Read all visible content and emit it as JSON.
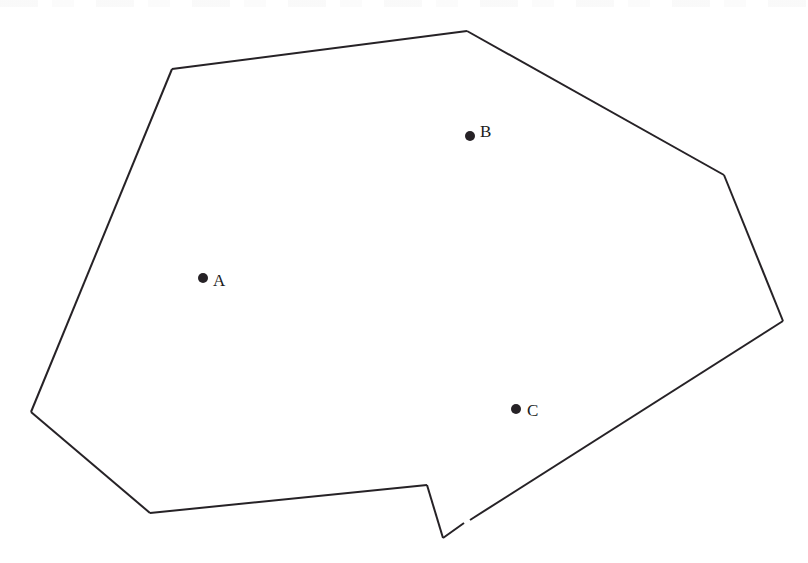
{
  "figure": {
    "kind": "polygon-line-drawing",
    "background_color": "#ffffff",
    "stroke_color": "#262226",
    "stroke_width": 2,
    "canvas": {
      "width": 808,
      "height": 563
    },
    "outline_points_label": "Irregular polygon outline",
    "outline_vertices": [
      [
        172,
        69
      ],
      [
        467,
        31
      ],
      [
        724,
        175
      ],
      [
        783,
        321
      ],
      [
        470,
        520
      ],
      [
        443,
        538
      ],
      [
        427,
        485
      ],
      [
        150,
        513
      ],
      [
        31,
        412
      ]
    ],
    "outline_path_segments": [
      {
        "name": "upper-left-to-top-peak",
        "from": [
          172,
          69
        ],
        "to": [
          467,
          31
        ]
      },
      {
        "name": "top-peak-to-upper-right",
        "from": [
          467,
          31
        ],
        "to": [
          724,
          175
        ]
      },
      {
        "name": "upper-right-to-right-apex",
        "from": [
          724,
          175
        ],
        "to": [
          783,
          321
        ]
      },
      {
        "name": "right-apex-to-notch-gap",
        "from": [
          783,
          321
        ],
        "to": [
          470,
          520
        ]
      },
      {
        "name": "notch-gap-to-notch-bottom",
        "from": [
          464,
          523
        ],
        "to": [
          443,
          538
        ]
      },
      {
        "name": "notch-bottom-to-notch-top",
        "from": [
          443,
          538
        ],
        "to": [
          427,
          485
        ]
      },
      {
        "name": "notch-top-to-bottom-left",
        "from": [
          427,
          485
        ],
        "to": [
          150,
          513
        ]
      },
      {
        "name": "bottom-left-to-left-apex",
        "from": [
          150,
          513
        ],
        "to": [
          31,
          412
        ]
      },
      {
        "name": "left-apex-to-upper-left",
        "from": [
          31,
          412
        ],
        "to": [
          172,
          69
        ]
      }
    ],
    "outline_gap": {
      "description": "small break in stroke on lower-right diagonal",
      "at": [
        467,
        521
      ]
    },
    "points": [
      {
        "id": "point-a",
        "label": "A",
        "dot": {
          "x": 203,
          "y": 278,
          "r": 5
        },
        "label_pos": {
          "x": 213,
          "y": 286
        }
      },
      {
        "id": "point-b",
        "label": "B",
        "dot": {
          "x": 470,
          "y": 136,
          "r": 5
        },
        "label_pos": {
          "x": 480,
          "y": 137
        }
      },
      {
        "id": "point-c",
        "label": "C",
        "dot": {
          "x": 516,
          "y": 409,
          "r": 5
        },
        "label_pos": {
          "x": 527,
          "y": 416
        }
      }
    ]
  }
}
